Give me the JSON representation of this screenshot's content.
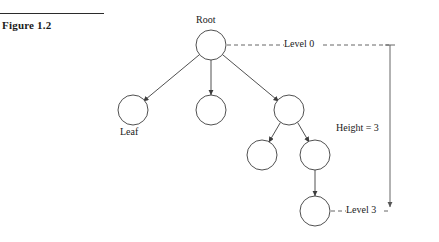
{
  "figure": {
    "caption": "Figure 1.2",
    "rule_color": "#2b2b2b"
  },
  "diagram": {
    "type": "tree-diagram",
    "stroke_color": "#3c3c3c",
    "dash_color": "#555555",
    "node_fill": "#ffffff",
    "labels": {
      "root": "Root",
      "leaf": "Leaf",
      "level0": "Level 0",
      "level3": "Level 3",
      "height": "Height = 3"
    },
    "nodes": [
      {
        "id": "root",
        "cx": 211,
        "cy": 45,
        "r": 15,
        "level": 0
      },
      {
        "id": "n1a",
        "cx": 133,
        "cy": 110,
        "r": 15,
        "level": 1
      },
      {
        "id": "n1b",
        "cx": 211,
        "cy": 110,
        "r": 15,
        "level": 1
      },
      {
        "id": "n1c",
        "cx": 289,
        "cy": 110,
        "r": 15,
        "level": 1
      },
      {
        "id": "n2a",
        "cx": 262,
        "cy": 155,
        "r": 15,
        "level": 2
      },
      {
        "id": "n2b",
        "cx": 315,
        "cy": 155,
        "r": 15,
        "level": 2
      },
      {
        "id": "n3a",
        "cx": 315,
        "cy": 211,
        "r": 15,
        "level": 3
      }
    ],
    "edges": [
      {
        "from": "root",
        "to": "n1a"
      },
      {
        "from": "root",
        "to": "n1b"
      },
      {
        "from": "root",
        "to": "n1c"
      },
      {
        "from": "n1c",
        "to": "n2a"
      },
      {
        "from": "n1c",
        "to": "n2b"
      },
      {
        "from": "n2b",
        "to": "n3a"
      }
    ],
    "measure": {
      "axis_x": 390,
      "top_y": 45,
      "bottom_y": 211,
      "cap_half_width": 5
    }
  }
}
